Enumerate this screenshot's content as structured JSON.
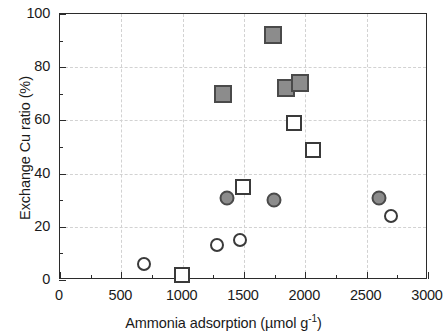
{
  "chart_data": {
    "type": "scatter",
    "title": "",
    "xlabel": "Ammonia adsorption (µmol g",
    "xlabel_sup": "-1",
    "xlabel_close": ")",
    "ylabel": "Exchange  Cu ratio (%)",
    "xlim": [
      0,
      3000
    ],
    "ylim": [
      0,
      100
    ],
    "xticks": [
      0,
      500,
      1000,
      1500,
      2000,
      2500,
      3000
    ],
    "yticks": [
      0,
      20,
      40,
      60,
      80,
      100
    ],
    "xtick_labels": [
      "0",
      "500",
      "1000",
      "1500",
      "2000",
      "2500",
      "3000"
    ],
    "ytick_labels": [
      "0",
      "20",
      "40",
      "60",
      "80",
      "100"
    ],
    "x_minor_interval": 250,
    "y_minor_interval": 10,
    "grid": true,
    "legend": "none",
    "colors": {
      "filled_marker_fill": "#8c8c8c",
      "filled_marker_edge": "#4a4a4a",
      "open_marker_fill": "#ffffff",
      "open_marker_edge": "#3a3a3a",
      "axis": "#2b2b2b",
      "grid": "#d2d2d2"
    },
    "series": [
      {
        "name": "filled-square",
        "marker": "square",
        "fill": "gray",
        "points": [
          {
            "x": 1325,
            "y": 70
          },
          {
            "x": 1740,
            "y": 92
          },
          {
            "x": 1845,
            "y": 72
          },
          {
            "x": 1955,
            "y": 74
          }
        ]
      },
      {
        "name": "open-square",
        "marker": "square",
        "fill": "white",
        "points": [
          {
            "x": 995,
            "y": 2
          },
          {
            "x": 1490,
            "y": 35
          },
          {
            "x": 1905,
            "y": 59
          },
          {
            "x": 2065,
            "y": 49
          }
        ]
      },
      {
        "name": "filled-circle",
        "marker": "circle",
        "fill": "gray",
        "points": [
          {
            "x": 1360,
            "y": 31
          },
          {
            "x": 1745,
            "y": 30
          },
          {
            "x": 2600,
            "y": 31
          }
        ]
      },
      {
        "name": "open-circle",
        "marker": "circle",
        "fill": "white",
        "points": [
          {
            "x": 685,
            "y": 6
          },
          {
            "x": 1280,
            "y": 13
          },
          {
            "x": 1470,
            "y": 15
          },
          {
            "x": 2700,
            "y": 24
          }
        ]
      }
    ]
  }
}
